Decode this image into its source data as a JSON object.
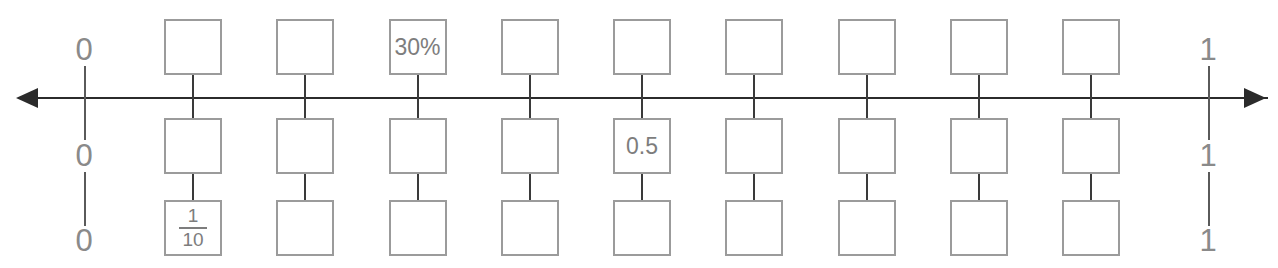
{
  "diagram": {
    "type": "number-line-with-equivalence-boxes",
    "title": "",
    "axis": {
      "left_arrow": "arrow-left",
      "right_arrow": "arrow-right",
      "orientation": "horizontal"
    },
    "scale_endpoints": {
      "left_labels": [
        "0",
        "0",
        "0"
      ],
      "right_labels": [
        "1",
        "1",
        "1"
      ]
    },
    "columns": 9,
    "rows": [
      {
        "name": "percent-row",
        "cells": [
          "",
          "",
          "30%",
          "",
          "",
          "",
          "",
          "",
          ""
        ]
      },
      {
        "name": "decimal-row",
        "cells": [
          "",
          "",
          "",
          "",
          "0.5",
          "",
          "",
          "",
          ""
        ]
      },
      {
        "name": "fraction-row",
        "cells": [
          {
            "numerator": "1",
            "denominator": "10"
          },
          "",
          "",
          "",
          "",
          "",
          "",
          "",
          ""
        ]
      }
    ],
    "colors": {
      "axis": "#2b2b2b",
      "box_border": "#9b9b9b",
      "box_text": "#7d7d7d",
      "end_label": "#8a8a8a",
      "connector": "#3a3a3a",
      "background": "#ffffff"
    }
  }
}
